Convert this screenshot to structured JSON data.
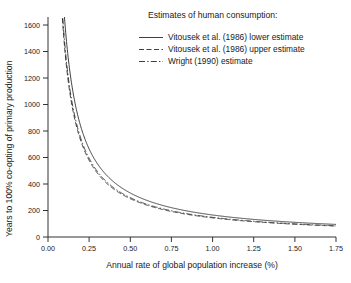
{
  "chart_data": {
    "type": "line",
    "title": "",
    "xlabel": "Annual rate of global population increase (%)",
    "ylabel": "Years to 100% co-opting of primary production",
    "xlim": [
      0.0,
      1.75
    ],
    "ylim": [
      0,
      1700
    ],
    "xticks": [
      "0.00",
      "0.25",
      "0.50",
      "0.75",
      "1.00",
      "1.25",
      "1.50",
      "1.75"
    ],
    "xtick_values": [
      0.0,
      0.25,
      0.5,
      0.75,
      1.0,
      1.25,
      1.5,
      1.75
    ],
    "yticks": [
      "0",
      "200",
      "400",
      "600",
      "800",
      "1000",
      "1200",
      "1400",
      "1600"
    ],
    "ytick_values": [
      0,
      200,
      400,
      600,
      800,
      1000,
      1200,
      1400,
      1600
    ],
    "grid": false,
    "legend_position": "top-right",
    "legend_title": "Estimates of human consumption:",
    "series": [
      {
        "name": "Vitousek et al. (1986) lower estimate",
        "style": "solid",
        "constant_k": 170,
        "x": [
          0.1,
          0.15,
          0.2,
          0.25,
          0.3,
          0.35,
          0.4,
          0.5,
          0.6,
          0.75,
          0.9,
          1.0,
          1.25,
          1.5,
          1.75
        ],
        "values": [
          1700,
          1133,
          850,
          680,
          567,
          486,
          425,
          340,
          283,
          227,
          189,
          170,
          136,
          113,
          97
        ]
      },
      {
        "name": "Vitousek et al. (1986) upper estimate",
        "style": "dashed",
        "constant_k": 148,
        "x": [
          0.1,
          0.15,
          0.2,
          0.25,
          0.3,
          0.35,
          0.4,
          0.5,
          0.6,
          0.75,
          0.9,
          1.0,
          1.25,
          1.5,
          1.75
        ],
        "values": [
          1480,
          987,
          740,
          592,
          493,
          423,
          370,
          296,
          247,
          197,
          164,
          148,
          118,
          99,
          85
        ]
      },
      {
        "name": "Wright (1990) estimate",
        "style": "dashdot",
        "constant_k": 152,
        "x": [
          0.1,
          0.15,
          0.2,
          0.25,
          0.3,
          0.35,
          0.4,
          0.5,
          0.6,
          0.75,
          0.9,
          1.0,
          1.25,
          1.5,
          1.75
        ],
        "values": [
          1520,
          1013,
          760,
          608,
          507,
          434,
          380,
          304,
          253,
          203,
          169,
          152,
          122,
          101,
          87
        ]
      }
    ]
  },
  "axes": {
    "x_title": "Annual rate of global population increase (%)",
    "y_title": "Years to 100% co-opting of primary production",
    "x_tick_labels": [
      "0.00",
      "0.25",
      "0.50",
      "0.75",
      "1.00",
      "1.25",
      "1.50",
      "1.75"
    ],
    "y_tick_labels": [
      "0",
      "200",
      "400",
      "600",
      "800",
      "1000",
      "1200",
      "1400",
      "1600"
    ]
  },
  "legend": {
    "title": "Estimates of human consumption:",
    "entries": [
      {
        "label": "Vitousek et al. (1986) lower estimate",
        "style": "solid"
      },
      {
        "label": "Vitousek et al. (1986) upper estimate",
        "style": "dashed"
      },
      {
        "label": "Wright (1990) estimate",
        "style": "dashdot"
      }
    ]
  }
}
